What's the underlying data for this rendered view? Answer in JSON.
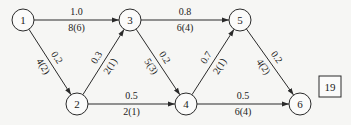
{
  "diagram": {
    "type": "directed-network",
    "nodes": [
      {
        "id": "1",
        "label": "1"
      },
      {
        "id": "2",
        "label": "2"
      },
      {
        "id": "3",
        "label": "3"
      },
      {
        "id": "4",
        "label": "4"
      },
      {
        "id": "5",
        "label": "5"
      },
      {
        "id": "6",
        "label": "6"
      }
    ],
    "edges": [
      {
        "from": "1",
        "to": "3",
        "top_label": "1.0",
        "bottom_label": "8(6)"
      },
      {
        "from": "3",
        "to": "5",
        "top_label": "0.8",
        "bottom_label": "6(4)"
      },
      {
        "from": "1",
        "to": "2",
        "top_label": "0.2",
        "bottom_label": "4(2)"
      },
      {
        "from": "2",
        "to": "3",
        "top_label": "0.3",
        "bottom_label": "2(1)"
      },
      {
        "from": "3",
        "to": "4",
        "top_label": "0.2",
        "bottom_label": "5(3)"
      },
      {
        "from": "4",
        "to": "5",
        "top_label": "0.7",
        "bottom_label": "2(1)"
      },
      {
        "from": "5",
        "to": "6",
        "top_label": "0.2",
        "bottom_label": "4(2)"
      },
      {
        "from": "2",
        "to": "4",
        "top_label": "0.5",
        "bottom_label": "2(1)"
      },
      {
        "from": "4",
        "to": "6",
        "top_label": "0.5",
        "bottom_label": "6(4)"
      }
    ],
    "figure_number_box": "19"
  }
}
